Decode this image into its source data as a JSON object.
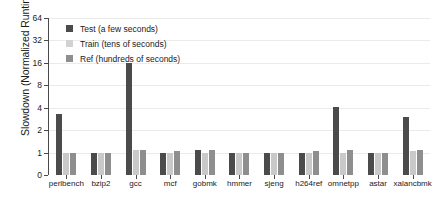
{
  "chart_data": {
    "type": "bar",
    "title": "",
    "xlabel": "",
    "ylabel": "Slowdown (Normalized Runtime)",
    "grid": true,
    "legend_position": "top-left",
    "yticks": [
      0,
      1,
      2,
      4,
      8,
      16,
      32,
      64
    ],
    "ytick_labels": [
      "0",
      "1",
      "2",
      "4",
      "8",
      "16",
      "32",
      "64"
    ],
    "yscale": "log2-like (0 then powers of two, evenly spaced)",
    "ylim": [
      0,
      64
    ],
    "categories": [
      "perlbench",
      "bzip2",
      "gcc",
      "mcf",
      "gobmk",
      "hmmer",
      "sjeng",
      "h264ref",
      "omnetpp",
      "astar",
      "xalancbmk"
    ],
    "series": [
      {
        "name": "Test (a few seconds)",
        "short_name": "Test",
        "color": "#4b4b4b",
        "values": [
          3.3,
          1.0,
          16.0,
          1.0,
          1.1,
          1.0,
          1.0,
          1.0,
          4.1,
          1.0,
          3.0
        ]
      },
      {
        "name": "Train (tens of seconds)",
        "short_name": "Train",
        "color": "#d2d2d2",
        "values": [
          1.0,
          1.0,
          1.1,
          1.0,
          1.0,
          1.0,
          1.0,
          1.0,
          1.0,
          1.0,
          1.05
        ]
      },
      {
        "name": "Ref (hundreds of seconds)",
        "short_name": "Ref",
        "color": "#8e8e8e",
        "values": [
          1.0,
          1.0,
          1.1,
          1.05,
          1.1,
          1.0,
          1.0,
          1.05,
          1.1,
          1.0,
          1.1
        ]
      }
    ]
  },
  "legend": {
    "entries": [
      {
        "label": "Test (a few seconds)"
      },
      {
        "label": "Train (tens of seconds)"
      },
      {
        "label": "Ref (hundreds of seconds)"
      }
    ]
  }
}
